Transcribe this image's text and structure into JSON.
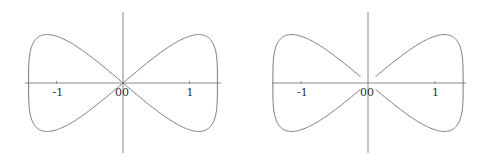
{
  "chart_data": [
    {
      "type": "line",
      "title": "",
      "description": "Closed figure-eight (butterfly) curve through origin",
      "xlabel": "",
      "ylabel": "",
      "xlim": [
        -1.45,
        1.45
      ],
      "x_ticks": [
        "-1",
        "1"
      ],
      "origin_labels": [
        "0",
        "0"
      ],
      "grid": false,
      "series": [
        {
          "name": "curve",
          "closed": true,
          "param": "x = 1.42*sin(t), y = 1.0*sin(t)*cos(t)^0.7 scaled; t in [0, 2pi]"
        }
      ]
    },
    {
      "type": "line",
      "title": "",
      "description": "Same figure-eight curve with gaps near the origin",
      "xlabel": "",
      "ylabel": "",
      "xlim": [
        -1.45,
        1.45
      ],
      "x_ticks": [
        "-1",
        "1"
      ],
      "origin_labels": [
        "0",
        "0"
      ],
      "grid": false,
      "series": [
        {
          "name": "curve",
          "closed": false,
          "gap_near_origin": true
        }
      ]
    }
  ],
  "plots": [
    {
      "ox": 123,
      "oy": 83,
      "unit": 66.5,
      "ampY": 68,
      "axisX": [
        25,
        221
      ],
      "axisY": [
        12,
        153
      ],
      "tickNeg": "-1",
      "tickPos": "1",
      "zeroA": "0",
      "zeroB": "0",
      "gap": 0
    },
    {
      "ox": 368,
      "oy": 83,
      "unit": 67,
      "ampY": 68,
      "axisX": [
        272,
        466
      ],
      "axisY": [
        12,
        153
      ],
      "tickNeg": "-1",
      "tickPos": "1",
      "zeroA": "0",
      "zeroB": "0",
      "gap": 0.09
    }
  ]
}
